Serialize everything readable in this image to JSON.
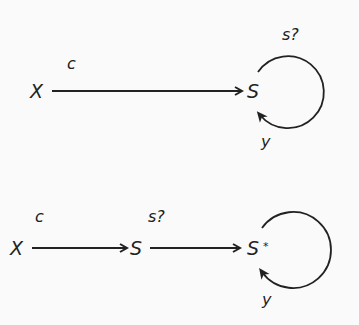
{
  "diagrams": [
    {
      "id": "top",
      "nodes": [
        {
          "id": "X",
          "label": "X"
        },
        {
          "id": "S",
          "label": "S"
        }
      ],
      "edges": [
        {
          "from": "X",
          "to": "S",
          "label": "c"
        },
        {
          "from": "S",
          "to": "S",
          "type": "self-loop",
          "label_top": "s?",
          "label_bottom": "y"
        }
      ]
    },
    {
      "id": "bottom",
      "nodes": [
        {
          "id": "X",
          "label": "X"
        },
        {
          "id": "S",
          "label": "S"
        },
        {
          "id": "S_star",
          "label": "S",
          "superscript": "*"
        }
      ],
      "edges": [
        {
          "from": "X",
          "to": "S",
          "label": "c"
        },
        {
          "from": "S",
          "to": "S_star",
          "label": "s?"
        },
        {
          "from": "S_star",
          "to": "S_star",
          "type": "self-loop",
          "label_bottom": "y"
        }
      ]
    }
  ],
  "colors": {
    "stroke": "#222222",
    "background": "#fafafa"
  }
}
